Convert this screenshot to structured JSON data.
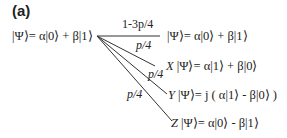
{
  "panel_label": "(a)",
  "input_state": "|Ψ⟩= α|0⟩ + β|1⟩",
  "branches": [
    {
      "probability": "1-3p/4",
      "result": "|Ψ⟩= α|0⟩ + β|1⟩",
      "operator": ""
    },
    {
      "probability": "p/4",
      "result": "|Ψ⟩= α|1⟩ + β|0⟩",
      "operator": "X"
    },
    {
      "probability": "p/4",
      "result": "|Ψ⟩= j ( α|1⟩ - β|0⟩ )",
      "operator": "Y"
    },
    {
      "probability": "p/4",
      "result": "|Ψ⟩= α|0⟩ - β|1⟩",
      "operator": "Z"
    }
  ],
  "line_color": "#333333"
}
